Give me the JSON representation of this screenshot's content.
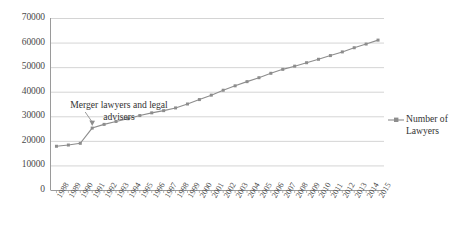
{
  "chart_data": {
    "type": "line",
    "title": "",
    "xlabel": "",
    "ylabel": "",
    "ylim": [
      0,
      70000
    ],
    "ytick_step": 10000,
    "yticks": [
      "0",
      "10000",
      "20000",
      "30000",
      "40000",
      "50000",
      "60000",
      "70000"
    ],
    "grid": true,
    "legend_position": "right",
    "categories": [
      "1988",
      "1989",
      "1990",
      "1991",
      "1992",
      "1993",
      "1994",
      "1995",
      "1996",
      "1997",
      "1998",
      "1999",
      "2000",
      "2001",
      "2002",
      "2003",
      "2004",
      "2005",
      "2006",
      "2007",
      "2008",
      "2009",
      "2010",
      "2011",
      "2012",
      "2013",
      "2014",
      "2015"
    ],
    "series": [
      {
        "name": "Number of Lawyers",
        "color": "#8d8d8d",
        "marker": "square",
        "values": [
          17800,
          18300,
          19000,
          25200,
          26700,
          27900,
          29000,
          30300,
          31400,
          32300,
          33400,
          35000,
          36800,
          38600,
          40600,
          42400,
          44100,
          45700,
          47500,
          49100,
          50400,
          51800,
          53200,
          54700,
          56200,
          57900,
          59400,
          61000
        ]
      }
    ],
    "annotations": [
      {
        "text": "Merger lawyers and legal advisers",
        "points_to_category": "1991",
        "points_to_value": 25200
      }
    ]
  },
  "legend": {
    "entries": [
      {
        "label_line1": "Number of",
        "label_line2": "Lawyers"
      }
    ]
  },
  "annotation": {
    "line1": "Merger lawyers and legal",
    "line2": "advisers"
  },
  "colors": {
    "series": "#8d8d8d",
    "grid": "#c9c9c9",
    "axis": "#9a9a9a",
    "text": "#3a3a3a",
    "background": "#ffffff"
  }
}
